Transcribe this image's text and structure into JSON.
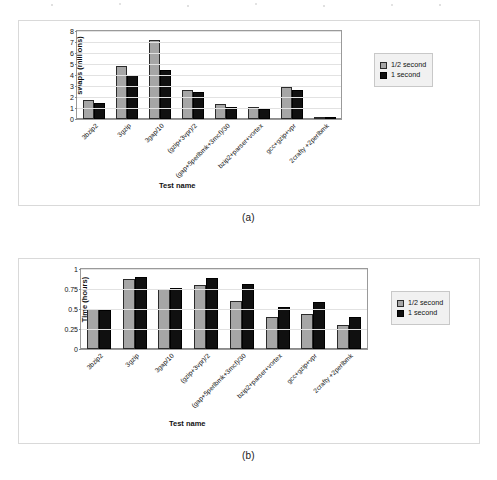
{
  "figure": {
    "panels": [
      {
        "caption": "(a)",
        "legend": {
          "position": "right",
          "entries": [
            "1/2 second",
            "1 second"
          ]
        }
      },
      {
        "caption": "(b)",
        "legend": {
          "position": "right",
          "entries": [
            "1/2 second",
            "1 second"
          ]
        }
      }
    ],
    "colors": {
      "series_half_second": "#a6a6a6",
      "series_one_second": "#101010",
      "grid": "#e2e2e2",
      "frame": "#d9d9d9",
      "legend_bg": "#f1f1f1"
    }
  },
  "chart_data": [
    {
      "type": "bar",
      "title": "",
      "xlabel": "Test name",
      "ylabel": "swaps (millions)",
      "ylim": [
        0,
        8
      ],
      "yticks": [
        0,
        1,
        2,
        3,
        4,
        5,
        6,
        7,
        8
      ],
      "ytick_labels": [
        "0",
        "1",
        "2",
        "3",
        "4",
        "5",
        "6",
        "7",
        "8"
      ],
      "grid": true,
      "legend": [
        "1/2 second",
        "1 second"
      ],
      "legend_position": "right",
      "categories": [
        "3bzip2",
        "3gzip",
        "3gap/10",
        "(gzip+3vpr)/2",
        "(gap+5perlbmk+3mcf)/30",
        "bzip2+parser+vortex",
        "gcc+gzip+vpr",
        "2crafty +2perlbmk"
      ],
      "series": [
        {
          "name": "1/2 second",
          "values": [
            1.7,
            4.85,
            7.15,
            2.65,
            1.4,
            1.1,
            2.9,
            0.2
          ]
        },
        {
          "name": "1 second",
          "values": [
            1.5,
            4.0,
            4.45,
            2.5,
            1.1,
            0.95,
            2.6,
            0.2
          ]
        }
      ]
    },
    {
      "type": "bar",
      "title": "",
      "xlabel": "Test name",
      "ylabel": "Time (hours)",
      "ylim": [
        0,
        1
      ],
      "yticks": [
        0,
        0.25,
        0.5,
        0.75,
        1
      ],
      "ytick_labels": [
        "0",
        "0.25",
        "0.5",
        "0.75",
        "1"
      ],
      "grid": true,
      "legend": [
        "1/2 second",
        "1 second"
      ],
      "legend_position": "right",
      "categories": [
        "3bzip2",
        "3gzip",
        "3gap/10",
        "(gzip+3vpr)/2",
        "(gap+5perlbmk+3mcf)/30",
        "bzip2+parser+vortex",
        "gcc+gzip+vpr",
        "2crafty +2perlbmk"
      ],
      "series": [
        {
          "name": "1/2 second",
          "values": [
            0.5,
            0.875,
            0.755,
            0.795,
            0.605,
            0.4,
            0.44,
            0.3
          ]
        },
        {
          "name": "1 second",
          "values": [
            0.49,
            0.905,
            0.765,
            0.885,
            0.81,
            0.525,
            0.585,
            0.4
          ]
        }
      ]
    }
  ]
}
